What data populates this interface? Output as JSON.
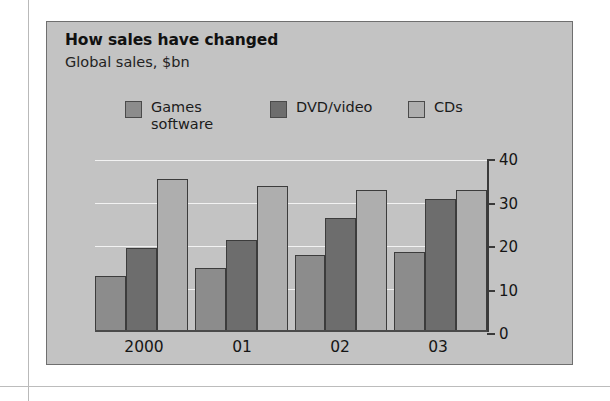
{
  "figure": {
    "title": "How sales have changed",
    "subtitle": "Global sales, $bn"
  },
  "chart_data": {
    "type": "bar",
    "title": "How sales have changed",
    "subtitle": "Global sales, $bn",
    "xlabel": "",
    "ylabel": "$bn",
    "ylim": [
      0,
      40
    ],
    "yticks": [
      0,
      10,
      20,
      30,
      40
    ],
    "grid": true,
    "axis_position": "right",
    "legend_position": "top",
    "categories": [
      "2000",
      "01",
      "02",
      "03"
    ],
    "series": [
      {
        "name": "Games\nsoftware",
        "label": "Games software",
        "color": "#8c8c8c",
        "values": [
          13,
          15,
          18,
          18.5
        ]
      },
      {
        "name": "DVD/video",
        "label": "DVD/video",
        "color": "#6d6d6d",
        "values": [
          19.5,
          21.5,
          26.5,
          31
        ]
      },
      {
        "name": "CDs",
        "label": "CDs",
        "color": "#aeaeae",
        "values": [
          35.5,
          34,
          33,
          33
        ]
      }
    ]
  },
  "colors": {
    "panel_background": "#c3c3c3",
    "panel_border": "#6f6f6f",
    "gridline": "#f2f2f2",
    "axis": "#3a3a3a",
    "bar_outline": "#3c3c3c"
  }
}
